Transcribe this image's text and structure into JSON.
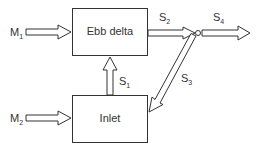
{
  "diagram": {
    "boxes": [
      {
        "id": "ebb-delta",
        "label": "Ebb delta"
      },
      {
        "id": "inlet",
        "label": "Inlet"
      }
    ],
    "flows": [
      {
        "id": "M1",
        "base": "M",
        "sub": "1",
        "from": "external",
        "to": "ebb-delta"
      },
      {
        "id": "M2",
        "base": "M",
        "sub": "2",
        "from": "external",
        "to": "inlet"
      },
      {
        "id": "S1",
        "base": "S",
        "sub": "1",
        "from": "inlet",
        "to": "ebb-delta"
      },
      {
        "id": "S2",
        "base": "S",
        "sub": "2",
        "from": "ebb-delta",
        "to": "junction"
      },
      {
        "id": "S3",
        "base": "S",
        "sub": "3",
        "from": "junction",
        "to": "inlet"
      },
      {
        "id": "S4",
        "base": "S",
        "sub": "4",
        "from": "junction",
        "to": "external"
      }
    ],
    "colors": {
      "stroke": "#333333",
      "background": "#ffffff"
    }
  }
}
